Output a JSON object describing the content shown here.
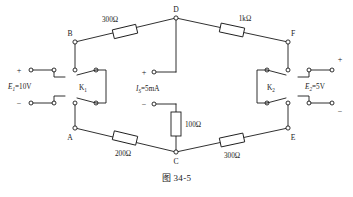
{
  "figure": {
    "caption": "图 34-5",
    "background_color": "#ffffff",
    "line_color": "#1a1a1a"
  },
  "nodes": [
    {
      "id": "A",
      "label": "A",
      "x": 75,
      "y": 128
    },
    {
      "id": "B",
      "label": "B",
      "x": 75,
      "y": 42
    },
    {
      "id": "C",
      "label": "C",
      "x": 176,
      "y": 152
    },
    {
      "id": "D",
      "label": "D",
      "x": 176,
      "y": 18
    },
    {
      "id": "E",
      "label": "E",
      "x": 288,
      "y": 128
    },
    {
      "id": "F",
      "label": "F",
      "x": 288,
      "y": 42
    }
  ],
  "resistors": [
    {
      "id": "R_BD",
      "label": "300Ω",
      "between": "B-D",
      "value": 300,
      "unit": "Ω"
    },
    {
      "id": "R_DF",
      "label": "1kΩ",
      "between": "D-F",
      "value": 1000,
      "unit": "Ω"
    },
    {
      "id": "R_AC",
      "label": "200Ω",
      "between": "A-C",
      "value": 200,
      "unit": "Ω"
    },
    {
      "id": "R_CE",
      "label": "300Ω",
      "between": "C-E",
      "value": 300,
      "unit": "Ω"
    },
    {
      "id": "R_SC",
      "label": "100Ω",
      "between": "Is-C",
      "value": 100,
      "unit": "Ω"
    }
  ],
  "sources": {
    "e1": {
      "name": "E1",
      "label_prefix": "E",
      "label_sub": "1",
      "label_value": "=10V",
      "full_label": "E₁=10V",
      "plus_sign": "+",
      "minus_sign": "−",
      "voltage": 10,
      "unit": "V"
    },
    "is": {
      "name": "Is",
      "label_prefix": "I",
      "label_sub": "S",
      "label_value": "=5mA",
      "full_label": "IS=5mA",
      "plus_sign": "+",
      "minus_sign": "−",
      "current": 5,
      "unit": "mA"
    },
    "e2": {
      "name": "E2",
      "label_prefix": "E",
      "label_sub": "2",
      "label_value": "=5V",
      "full_label": "E₂=5V",
      "plus_sign": "+",
      "minus_sign": "−",
      "voltage": 5,
      "unit": "V"
    }
  },
  "switches": [
    {
      "id": "K1",
      "label_prefix": "K",
      "label_sub": "1",
      "full_label": "K₁",
      "position": "left",
      "type": "double-pole"
    },
    {
      "id": "K2",
      "label_prefix": "K",
      "label_sub": "2",
      "full_label": "K₂",
      "position": "right",
      "type": "double-pole"
    }
  ]
}
